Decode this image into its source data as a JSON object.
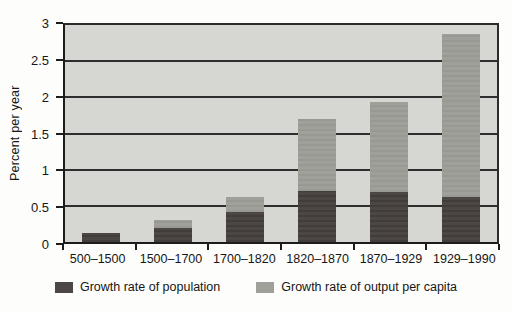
{
  "chart_data": {
    "type": "bar",
    "stacked": true,
    "ylabel": "Percent per year",
    "categories": [
      "500–1500",
      "1500–1700",
      "1700–1820",
      "1820–1870",
      "1870–1929",
      "1929–1990"
    ],
    "series": [
      {
        "name": "Growth rate of population",
        "color": "#4c4745",
        "stripe_color": "#423d3b",
        "values": [
          0.13,
          0.2,
          0.42,
          0.7,
          0.69,
          0.62
        ]
      },
      {
        "name": "Growth rate of output per capita",
        "color": "#a0a09b",
        "stripe_color": "#999994",
        "values": [
          0.0,
          0.11,
          0.2,
          1.0,
          1.24,
          2.25
        ]
      }
    ],
    "ylim": [
      0,
      3
    ],
    "yticks": [
      0,
      0.5,
      1,
      1.5,
      2,
      2.5,
      3
    ],
    "grid": true,
    "legend_position": "bottom",
    "plot_background": "#d6d6d2"
  }
}
